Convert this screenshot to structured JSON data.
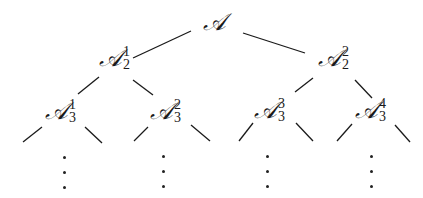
{
  "diagram": {
    "type": "binary-tree",
    "root": {
      "symbol": "𝒜",
      "sup": "",
      "sub": ""
    },
    "level2": [
      {
        "symbol": "𝒜",
        "sup": "1",
        "sub": "2"
      },
      {
        "symbol": "𝒜",
        "sup": "2",
        "sub": "2"
      }
    ],
    "level3": [
      {
        "symbol": "𝒜",
        "sup": "1",
        "sub": "3"
      },
      {
        "symbol": "𝒜",
        "sup": "2",
        "sub": "3"
      },
      {
        "symbol": "𝒜",
        "sup": "3",
        "sub": "3"
      },
      {
        "symbol": "𝒜",
        "sup": "4",
        "sub": "3"
      }
    ],
    "continuation": "⋮",
    "line_color": "#1a1a1a"
  }
}
